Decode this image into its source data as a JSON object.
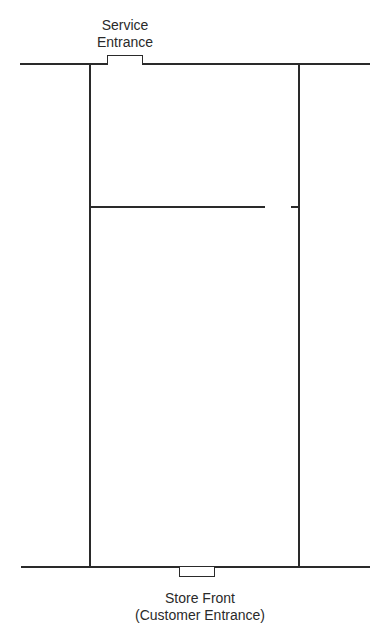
{
  "diagram": {
    "type": "floor-plan",
    "labels": {
      "service_line1": "Service",
      "service_line2": "Entrance",
      "front_line1": "Store Front",
      "front_line2": "(Customer Entrance)"
    },
    "colors": {
      "line": "#2a2a2a",
      "background": "#ffffff"
    }
  }
}
